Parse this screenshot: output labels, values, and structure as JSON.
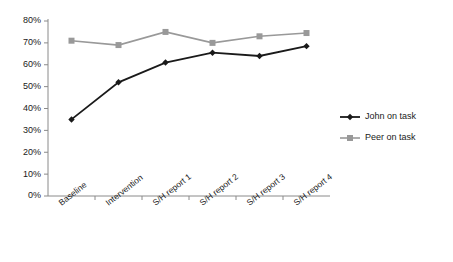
{
  "chart_data": {
    "type": "line",
    "title": "",
    "xlabel": "",
    "ylabel": "",
    "categories": [
      "Baseline",
      "Intervention",
      "S/H report 1",
      "S/H report 2",
      "S/H report 3",
      "S/H report 4"
    ],
    "series": [
      {
        "name": "John on task",
        "values": [
          35,
          52,
          61,
          65.5,
          64,
          68.5
        ],
        "color": "#1a1a1a",
        "marker": "diamond"
      },
      {
        "name": "Peer on task",
        "values": [
          71,
          69,
          75,
          70,
          73,
          74.5
        ],
        "color": "#999999",
        "marker": "square"
      }
    ],
    "ylim": [
      0,
      80
    ],
    "ytick_values": [
      0,
      10,
      20,
      30,
      40,
      50,
      60,
      70,
      80
    ],
    "ytick_labels": [
      "0%",
      "10%",
      "20%",
      "30%",
      "40%",
      "50%",
      "60%",
      "70%",
      "80%"
    ],
    "grid": false,
    "legend_position": "right"
  },
  "legend": {
    "entries": [
      {
        "label": "John on task"
      },
      {
        "label": "Peer on task"
      }
    ]
  }
}
